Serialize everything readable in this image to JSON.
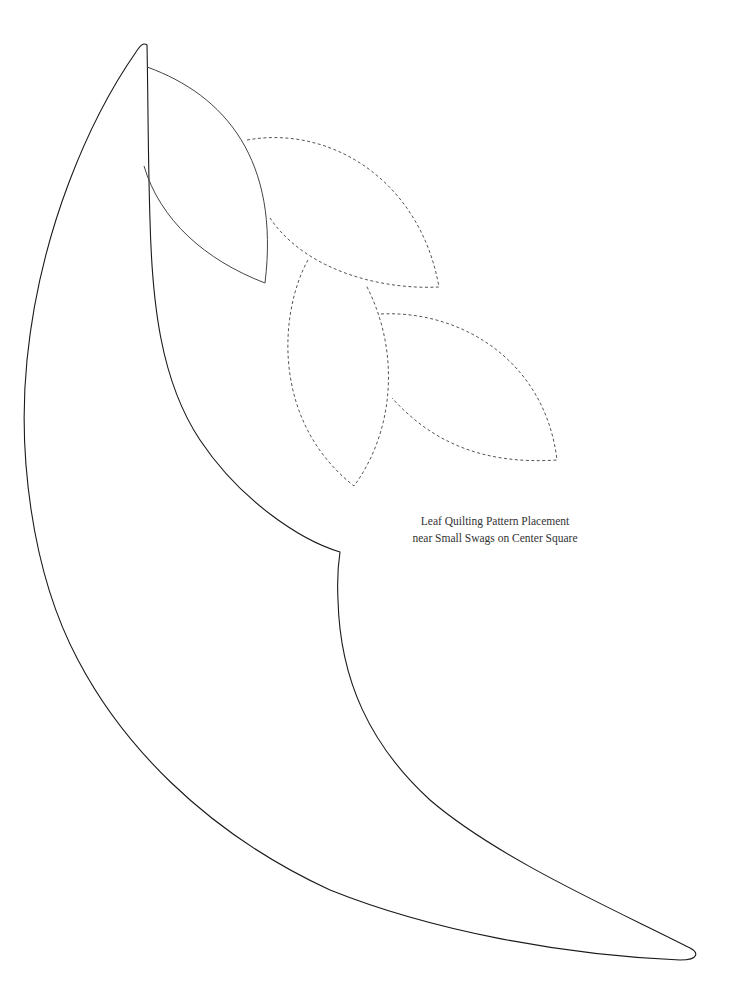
{
  "caption": {
    "line1": "Leaf Quilting Pattern Placement",
    "line2": "near Small Swags on Center Square"
  },
  "colors": {
    "background": "#ffffff",
    "solid_stroke": "#1a1a1a",
    "leaf_stroke": "#444444",
    "dashed_stroke": "#555555",
    "text": "#333333"
  },
  "shapes": {
    "swag": {
      "style": "solid"
    },
    "leaf_solid": {
      "style": "solid"
    },
    "leaf_dashed_1": {
      "style": "dashed"
    },
    "leaf_dashed_2": {
      "style": "dashed"
    },
    "leaf_dashed_3": {
      "style": "dashed"
    }
  }
}
